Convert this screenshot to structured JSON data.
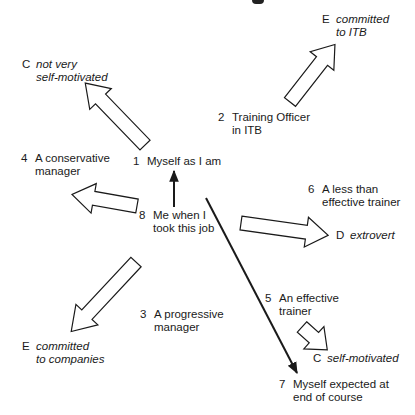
{
  "diagram": {
    "states": [
      {
        "id": "1",
        "num": "1",
        "lines": [
          "Myself as I am"
        ]
      },
      {
        "id": "2",
        "num": "2",
        "lines": [
          "Training Officer",
          "in ITB"
        ]
      },
      {
        "id": "3",
        "num": "3",
        "lines": [
          "A progressive",
          "manager"
        ]
      },
      {
        "id": "4",
        "num": "4",
        "lines": [
          "A conservative",
          "manager"
        ]
      },
      {
        "id": "5",
        "num": "5",
        "lines": [
          "An effective",
          "trainer"
        ]
      },
      {
        "id": "6",
        "num": "6",
        "lines": [
          "A less than",
          "effective trainer"
        ]
      },
      {
        "id": "7",
        "num": "7",
        "lines": [
          "Myself expected at",
          "end of course"
        ]
      },
      {
        "id": "8",
        "num": "8",
        "lines": [
          "Me when I",
          "took this job"
        ]
      }
    ],
    "outcomes": [
      {
        "letter": "C",
        "lines": [
          "not very",
          "self-motivated"
        ]
      },
      {
        "letter": "E",
        "lines": [
          "committed",
          "to ITB"
        ]
      },
      {
        "letter": "D",
        "lines": [
          "extrovert"
        ]
      },
      {
        "letter": "E",
        "lines": [
          "committed",
          "to companies"
        ]
      },
      {
        "letter": "C",
        "lines": [
          "self-motivated"
        ]
      }
    ],
    "arrows": [
      {
        "from": "4",
        "to": "C not very self-motivated",
        "style": "hollow"
      },
      {
        "from": "2",
        "to": "E committed to ITB",
        "style": "hollow"
      },
      {
        "from": "8",
        "to": "4",
        "style": "hollow"
      },
      {
        "from": "8",
        "to": "1",
        "style": "thin"
      },
      {
        "from": "8",
        "to": "7",
        "style": "thin"
      },
      {
        "from": "6",
        "to": "D extrovert",
        "style": "hollow"
      },
      {
        "from": "3",
        "to": "E committed to companies",
        "style": "hollow"
      },
      {
        "from": "5",
        "to": "C self-motivated",
        "style": "hollow"
      }
    ],
    "colors": {
      "ink": "#1a1a1a",
      "background": "#ffffff"
    }
  }
}
